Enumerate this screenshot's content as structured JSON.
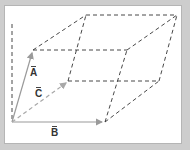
{
  "diagram": {
    "type": "parallelepiped-vectors",
    "colors": {
      "background_frame": "#cdcdcd",
      "panel": "#ffffff",
      "solid_vector": "#9a9a9a",
      "dashed_edge": "#333333",
      "dashed_vector_c": "#a8a8a8"
    },
    "vectors": [
      {
        "id": "A",
        "label": "A",
        "from": [
          12,
          122
        ],
        "to": [
          33,
          50
        ],
        "style": "solid"
      },
      {
        "id": "B",
        "label": "B",
        "from": [
          12,
          122
        ],
        "to": [
          105,
          122
        ],
        "style": "solid"
      },
      {
        "id": "C",
        "label": "C",
        "from": [
          12,
          122
        ],
        "to": [
          68,
          81
        ],
        "style": "dashed"
      }
    ],
    "labels": {
      "A": "A",
      "B": "B",
      "C": "C"
    },
    "vertical_axis": {
      "from": [
        12,
        24
      ],
      "to": [
        12,
        122
      ],
      "style": "dashed"
    }
  }
}
